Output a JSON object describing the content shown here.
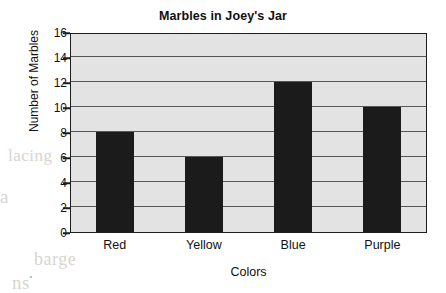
{
  "chart_data": {
    "type": "bar",
    "title": "Marbles in Joey's Jar",
    "xlabel": "Colors",
    "ylabel": "Number of Marbles",
    "categories": [
      "Red",
      "Yellow",
      "Blue",
      "Purple"
    ],
    "values": [
      8,
      6,
      12,
      10
    ],
    "ylim": [
      0,
      16
    ],
    "ytick_values": [
      16,
      14,
      12,
      10,
      8,
      6,
      4,
      2,
      0
    ],
    "ytick_labels": [
      "16",
      "14",
      "12",
      "10",
      "8",
      "6",
      "4",
      "2",
      "0"
    ],
    "ytick_step": 2,
    "grid": true,
    "grid_axis": "y",
    "legend": false,
    "bar_color": "#1b1b1b",
    "plot_background": "#e3e3e3",
    "axis_color": "#1d1d1d",
    "gridline_color": "#55585a",
    "page_background": "#ffffff"
  },
  "ghost_text": {
    "line_1": "lacing",
    "line_2": "a",
    "line_3": "barge",
    "line_4": "ns",
    "line_5": "r the",
    "line_6": "of the"
  }
}
